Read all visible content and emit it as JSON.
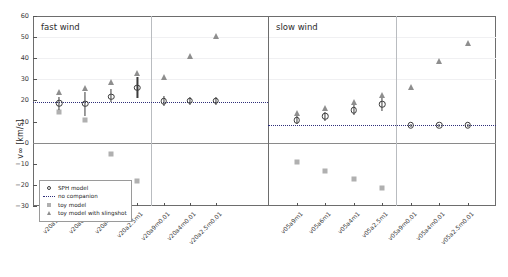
{
  "figure": {
    "ylabel": "v∞ [km/s]",
    "panels": [
      {
        "name": "fast-wind",
        "title": "fast wind"
      },
      {
        "name": "slow-wind",
        "title": "slow wind"
      }
    ]
  },
  "legend": {
    "position": "lower-left",
    "items": [
      {
        "key": "circle",
        "label": "SPH model"
      },
      {
        "key": "dotted-line",
        "label": "no companion"
      },
      {
        "key": "square",
        "label": "toy model"
      },
      {
        "key": "triangle",
        "label": "toy model with slingshot"
      }
    ]
  },
  "colors": {
    "sph": "#3b3b3b",
    "no_companion": "#2f2f7a",
    "toy_model": "#b0b0b0",
    "toy_model_slingshot": "#8e8e8e",
    "axis": "#6d6d6d",
    "zero_line": "#8a8a8a"
  },
  "chart_data": {
    "type": "scatter",
    "title": "",
    "xlabel": "",
    "ylabel": "v∞ [km/s]",
    "ylim": [
      -30,
      60
    ],
    "yticks": [
      -30,
      -20,
      -10,
      0,
      10,
      20,
      30,
      40,
      50,
      60
    ],
    "grid": false,
    "legend_position": "lower left",
    "panels": [
      {
        "name": "fast wind",
        "categories": [
          "v20a9m1",
          "v20a6m1",
          "v20a4m1",
          "v20a2.5m1",
          "v20a9m0.01",
          "v20a4m0.01",
          "v20a2.5m0.01",
          "v20a2.5m0.01"
        ],
        "no_companion": 19.5,
        "series": [
          {
            "name": "SPH model",
            "values": [
              18.6,
              18.5,
              21.8,
              26.0,
              19.7,
              19.8,
              19.8,
              null
            ],
            "err_low": [
              3.2,
              6.0,
              2.6,
              5.0,
              2.3,
              2.0,
              1.8,
              null
            ],
            "err_high": [
              3.0,
              5.5,
              3.4,
              5.2,
              2.2,
              2.0,
              1.8,
              null
            ]
          },
          {
            "name": "no companion",
            "values": [
              19.5,
              19.5,
              19.5,
              19.5,
              19.5,
              19.5,
              19.5,
              19.5
            ]
          },
          {
            "name": "toy model",
            "values": [
              14.6,
              10.6,
              -5.3,
              -18.2,
              null,
              null,
              null,
              null
            ]
          },
          {
            "name": "toy model with slingshot",
            "values": [
              23.8,
              26.0,
              28.8,
              33.2,
              31.2,
              41.2,
              50.5,
              null
            ]
          }
        ]
      },
      {
        "name": "slow wind",
        "categories": [
          "v05a9m1",
          "v05a6m1",
          "v05a4m1",
          "v05a2.5m1",
          "v05a9m0.01",
          "v05a4m0.01",
          "v05a2.5m0.01"
        ],
        "no_companion": 8.2,
        "series": [
          {
            "name": "SPH model",
            "values": [
              10.6,
              12.5,
              15.4,
              18.3,
              8.2,
              8.2,
              8.2
            ],
            "err_low": [
              1.9,
              2.3,
              2.5,
              3.2,
              0.8,
              0.8,
              0.8
            ],
            "err_high": [
              1.8,
              2.1,
              2.4,
              3.0,
              0.8,
              0.8,
              0.8
            ]
          },
          {
            "name": "no companion",
            "values": [
              8.2,
              8.2,
              8.2,
              8.2,
              8.2,
              8.2,
              8.2
            ]
          },
          {
            "name": "toy model",
            "values": [
              -9.1,
              -13.2,
              -17.4,
              -21.4,
              null,
              null,
              null
            ]
          },
          {
            "name": "toy model with slingshot",
            "values": [
              14.0,
              16.4,
              19.3,
              22.6,
              26.6,
              38.6,
              47.0
            ]
          }
        ]
      }
    ]
  }
}
